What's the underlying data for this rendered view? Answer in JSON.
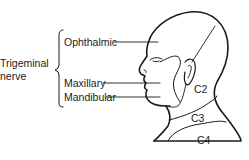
{
  "diagram": {
    "group_label_line1": "Trigeminal",
    "group_label_line2": "nerve",
    "branches": [
      {
        "label": "Ophthalmic"
      },
      {
        "label": "Maxillary"
      },
      {
        "label": "Mandibular"
      }
    ],
    "cervical_regions": [
      {
        "label": "C2"
      },
      {
        "label": "C3"
      },
      {
        "label": "C4"
      }
    ],
    "line_color": "#1a1a1a"
  }
}
